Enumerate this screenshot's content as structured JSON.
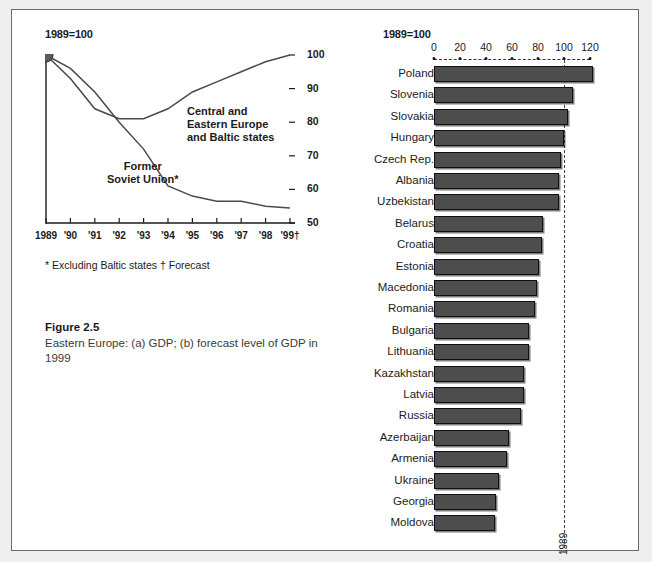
{
  "figure": {
    "caption_title": "Figure 2.5",
    "caption_text": "Eastern Europe: (a) GDP; (b) forecast level of GDP in 1999"
  },
  "panel_a": {
    "title": "1989=100",
    "footnote": "* Excluding Baltic states  † Forecast",
    "label_cee": "Central and\nEastern Europe\nand Baltic states",
    "label_fsu": "Former\nSoviet Union*"
  },
  "panel_b": {
    "title": "1989=100",
    "reference_label": "1989"
  },
  "chart_data": [
    {
      "id": "panel-a",
      "type": "line",
      "title": "1989=100",
      "xlabel": "",
      "ylabel": "1989=100",
      "ylim": [
        50,
        100
      ],
      "yticks": [
        50,
        60,
        70,
        80,
        90,
        100
      ],
      "x": [
        "1989",
        "'90",
        "'91",
        "'92",
        "'93",
        "'94",
        "'95",
        "'96",
        "'97",
        "'98",
        "'99†"
      ],
      "grid": false,
      "legend": "inline-annotations",
      "series": [
        {
          "name": "Central and Eastern Europe and Baltic states",
          "values": [
            100,
            93,
            84,
            81,
            81,
            84,
            89,
            92,
            95,
            98,
            100
          ]
        },
        {
          "name": "Former Soviet Union*",
          "values": [
            100,
            96,
            89,
            80,
            72,
            61,
            58,
            56.5,
            56.5,
            55,
            54.5
          ]
        }
      ],
      "annotations": [
        "* Excluding Baltic states",
        "† Forecast"
      ],
      "marker_note": "Filled circle marker at 1989 = 100 (shared origin)"
    },
    {
      "id": "panel-b",
      "type": "bar",
      "orientation": "horizontal",
      "title": "1989=100",
      "xlabel": "",
      "ylabel": "",
      "xlim": [
        0,
        126
      ],
      "xticks": [
        0,
        20,
        40,
        60,
        80,
        100,
        120
      ],
      "reference_line": {
        "value": 100,
        "label": "1989",
        "style": "dashed"
      },
      "grid": false,
      "categories": [
        "Poland",
        "Slovenia",
        "Slovakia",
        "Hungary",
        "Czech Rep.",
        "Albania",
        "Uzbekistan",
        "Belarus",
        "Croatia",
        "Estonia",
        "Macedonia",
        "Romania",
        "Bulgaria",
        "Lithuania",
        "Kazakhstan",
        "Latvia",
        "Russia",
        "Azerbaijan",
        "Armenia",
        "Ukraine",
        "Georgia",
        "Moldova"
      ],
      "values": [
        122,
        107,
        103,
        100,
        98,
        96,
        96,
        84,
        83,
        81,
        79,
        78,
        73,
        73,
        69,
        69,
        67,
        58,
        56,
        50,
        48,
        47
      ]
    }
  ]
}
